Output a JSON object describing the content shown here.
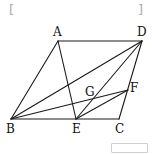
{
  "brackets": {
    "left": "[",
    "right": "]"
  },
  "points": {
    "A": {
      "label": "A",
      "x": 58,
      "y": 41
    },
    "D": {
      "label": "D",
      "x": 142,
      "y": 41
    },
    "B": {
      "label": "B",
      "x": 11,
      "y": 119
    },
    "E": {
      "label": "E",
      "x": 76,
      "y": 119
    },
    "C": {
      "label": "C",
      "x": 119,
      "y": 119
    },
    "F": {
      "label": "F",
      "x": 128,
      "y": 90
    },
    "G": {
      "label": "G",
      "x": 94,
      "y": 98
    }
  },
  "segments": [
    "AD",
    "AB",
    "DC",
    "BC",
    "AE",
    "BD",
    "DE",
    "BF",
    "EF"
  ],
  "line_color": "#1a1a1a",
  "answer_box": {
    "text": ""
  }
}
